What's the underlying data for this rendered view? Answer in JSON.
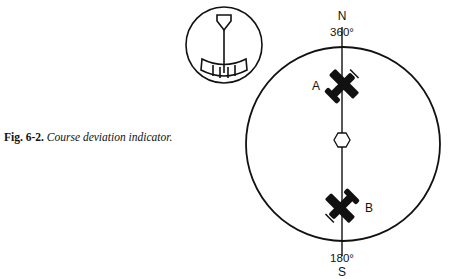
{
  "caption": {
    "number": "Fig. 6-2.",
    "text": "Course deviation indicator."
  },
  "indicator": {
    "north_label": "N",
    "north_heading": "360°",
    "south_heading": "180°",
    "south_label": "S",
    "aircraft": [
      {
        "label": "A",
        "position": "north of station"
      },
      {
        "label": "B",
        "position": "south of station"
      }
    ]
  },
  "colors": {
    "ink": "#111111",
    "background": "#ffffff"
  }
}
